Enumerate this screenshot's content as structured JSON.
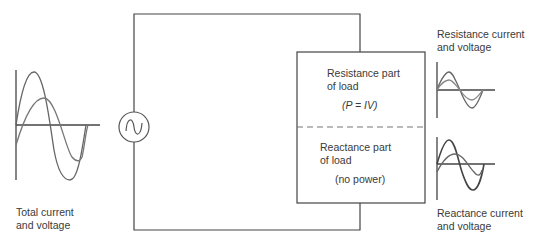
{
  "labels": {
    "total": {
      "line1": "Total current",
      "line2": "and voltage"
    },
    "resistance_graph": {
      "line1": "Resistance current",
      "line2": "and voltage"
    },
    "reactance_graph": {
      "line1": "Reactance current",
      "line2": "and voltage"
    },
    "resistance_part": {
      "line1": "Resistance part",
      "line2": "of load",
      "formula": "(P = IV)"
    },
    "reactance_part": {
      "line1": "Reactance part",
      "line2": "of load",
      "note": "(no power)"
    }
  },
  "components": {
    "source": {
      "type": "ac-voltage-source",
      "symbol": "~"
    },
    "load": {
      "sections": [
        "resistance",
        "reactance"
      ],
      "divider": "dashed"
    }
  },
  "colors": {
    "line": "#444444",
    "wave_dark": "#555555",
    "wave_light": "#777777",
    "dash": "#777777"
  }
}
